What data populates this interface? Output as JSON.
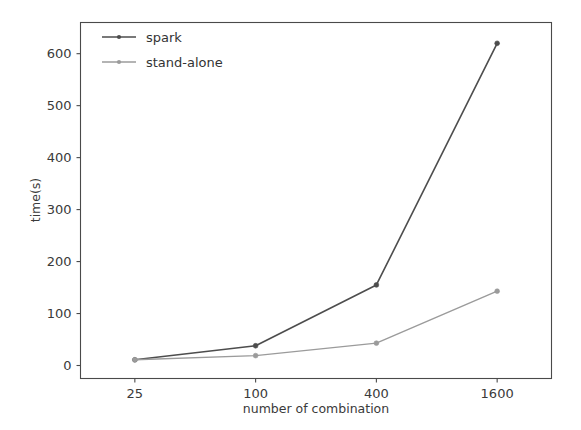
{
  "chart_data": {
    "type": "line",
    "title": "",
    "xlabel": "number of combination",
    "ylabel": "time(s)",
    "categories": [
      "25",
      "100",
      "400",
      "1600"
    ],
    "xticklabels": [
      "25",
      "100",
      "400",
      "1600"
    ],
    "yticklabels": [
      "0",
      "100",
      "200",
      "300",
      "400",
      "500",
      "600"
    ],
    "yticks": [
      0,
      100,
      200,
      300,
      400,
      500,
      600
    ],
    "ylim": [
      -25,
      660
    ],
    "xlim": [
      -0.45,
      3.45
    ],
    "grid": false,
    "legend_position": "upper left",
    "series": [
      {
        "name": "spark",
        "values": [
          11,
          38,
          155,
          620
        ],
        "color": "#4d4d4d",
        "marker": "dot",
        "linewidth": 1.6
      },
      {
        "name": "stand-alone",
        "values": [
          11,
          19,
          43,
          143
        ],
        "color": "#9b9b9b",
        "marker": "dot",
        "linewidth": 1.4
      }
    ]
  },
  "axes": {
    "y_axis_label": "time(s)",
    "x_axis_label": "number of combination"
  },
  "legend": {
    "entries": [
      {
        "label": "spark"
      },
      {
        "label": "stand-alone"
      }
    ]
  },
  "colors": {
    "spark": "#4d4d4d",
    "standalone": "#9b9b9b",
    "axis": "#4a4a4a",
    "text": "#3a3a3a",
    "background": "#ffffff"
  }
}
